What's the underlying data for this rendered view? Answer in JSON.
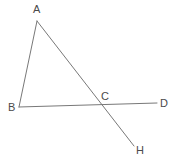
{
  "figure": {
    "type": "geometry-diagram",
    "width": 180,
    "height": 166,
    "background_color": "#ffffff",
    "stroke_color": "#787878",
    "stroke_width": 1,
    "label_color": "#4a4a4a",
    "label_font_size": 11
  },
  "points": {
    "A": {
      "label": "A",
      "x": 37,
      "y": 21,
      "label_x": 33,
      "label_y": 4
    },
    "B": {
      "label": "B",
      "x": 19,
      "y": 107,
      "label_x": 8,
      "label_y": 102
    },
    "C": {
      "label": "C",
      "x": 99,
      "y": 105,
      "label_x": 101,
      "label_y": 91
    },
    "D": {
      "label": "D",
      "x": 157,
      "y": 103,
      "label_x": 160,
      "label_y": 98
    },
    "H": {
      "label": "H",
      "x": 134,
      "y": 146,
      "label_x": 136,
      "label_y": 145
    }
  },
  "segments": [
    {
      "name": "segment-AB",
      "from": "A",
      "to": "B",
      "x1": 37,
      "y1": 21,
      "x2": 19,
      "y2": 107
    },
    {
      "name": "segment-AH",
      "from": "A",
      "to": "H",
      "x1": 37,
      "y1": 21,
      "x2": 134,
      "y2": 146
    },
    {
      "name": "segment-BD",
      "from": "B",
      "to": "D",
      "x1": 19,
      "y1": 107,
      "x2": 157,
      "y2": 103
    }
  ],
  "labels_list": [
    "A",
    "B",
    "C",
    "D",
    "H"
  ]
}
